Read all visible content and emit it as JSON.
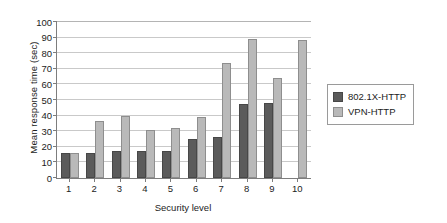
{
  "chart_data": {
    "type": "bar",
    "title": "",
    "xlabel": "Security level",
    "ylabel": "Mean response time (sec)",
    "categories": [
      "1",
      "2",
      "3",
      "4",
      "5",
      "6",
      "7",
      "8",
      "9",
      "10"
    ],
    "series": [
      {
        "name": "802.1X-HTTP",
        "color": "#5b5b5b",
        "values": [
          16,
          16,
          17.5,
          17,
          17,
          25,
          26.5,
          47.5,
          48,
          0
        ]
      },
      {
        "name": "VPN-HTTP",
        "color": "#b9b9b9",
        "values": [
          16,
          36.5,
          39.5,
          30.5,
          32,
          39,
          74,
          89,
          64,
          88.5
        ]
      }
    ],
    "ylim": [
      0,
      100
    ],
    "ytick_values": [
      0,
      10,
      20,
      30,
      40,
      50,
      60,
      70,
      80,
      90,
      100
    ],
    "ytick_labels": [
      "0",
      "10",
      "20",
      "30",
      "40",
      "50",
      "60",
      "70",
      "80",
      "90",
      "100"
    ],
    "grid": true,
    "grid_axis": "y",
    "legend_position": "right"
  },
  "legend": {
    "entries": [
      {
        "label": "802.1X-HTTP"
      },
      {
        "label": "VPN-HTTP"
      }
    ]
  }
}
